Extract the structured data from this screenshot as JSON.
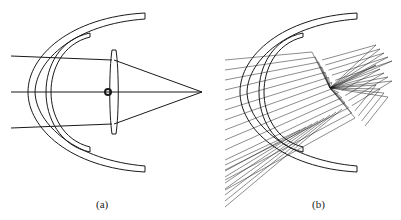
{
  "figure": {
    "panels": [
      {
        "id": "a",
        "label": "(a)",
        "description": "Parallel rays through curved visor shells focused by a lens to a single point"
      },
      {
        "id": "b",
        "label": "(b)",
        "description": "Ray fan through curved visor shells with multiple reflections"
      }
    ]
  },
  "colors": {
    "stroke": "#1a1a1a",
    "background": "#ffffff"
  }
}
